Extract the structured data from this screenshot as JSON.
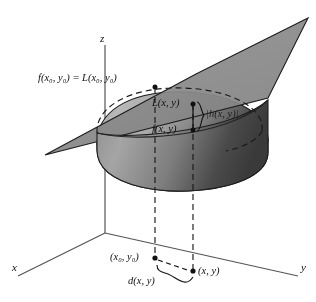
{
  "figure": {
    "axes": {
      "x_label": "x",
      "y_label": "y",
      "z_label": "z"
    },
    "labels": {
      "tangent_point": "f(x₀, y₀) = L(x₀, y₀)",
      "tangent_point_parts": {
        "f_prefix": "f(x",
        "f_sub": "0",
        "f_mid": ", y",
        "f_sub2": "0",
        "f_close": ")",
        "equals": "=",
        "L_prefix": "L(x",
        "L_sub": "0",
        "L_mid": ", y",
        "L_sub2": "0",
        "L_close": ")"
      },
      "plane_value": "L(x, y)",
      "surface_value": "f(x, y)",
      "error": "|h(x, y)|",
      "base_point": "(x₀, y₀)",
      "near_point": "(x, y)",
      "distance": "d(x, y)"
    },
    "colors": {
      "plane_fill": "#8c8c8c",
      "surface_light": "#b3b3b3",
      "surface_dark": "#4a4a4a",
      "stroke": "#1a1a1a",
      "axis": "#4d4d4d",
      "background": "#ffffff"
    },
    "geometry": {
      "origin": [
        105,
        233
      ],
      "x_axis_end": [
        18,
        276
      ],
      "y_axis_end": [
        298,
        276
      ],
      "z_axis_top": [
        105,
        45
      ],
      "plane_corners": [
        [
          45,
          155
        ],
        [
          196,
          74
        ],
        [
          308,
          18
        ],
        [
          268,
          98
        ]
      ],
      "base_point_px": [
        155,
        259
      ],
      "near_point_px": [
        193,
        272
      ],
      "tangent_point_px": [
        155,
        87
      ],
      "plane_value_px": [
        196,
        104
      ],
      "surface_value_px": [
        196,
        130
      ]
    }
  }
}
